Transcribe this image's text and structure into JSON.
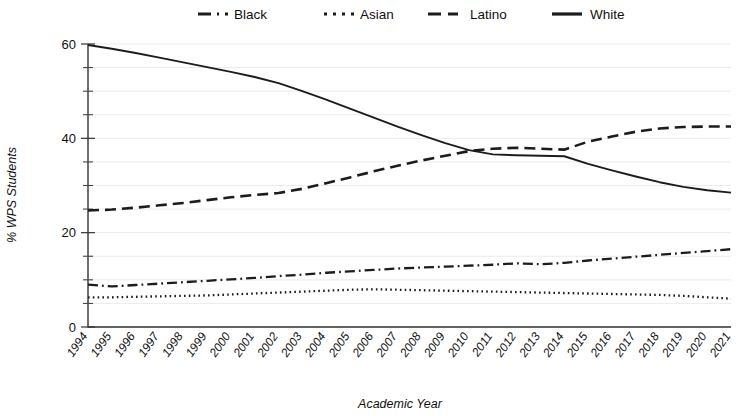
{
  "chart_data": {
    "type": "line",
    "title": "",
    "xlabel": "Academic Year",
    "ylabel": "% WPS Students",
    "xlim": [
      1994,
      2021
    ],
    "ylim": [
      0,
      60
    ],
    "yticks": [
      0,
      20,
      40,
      60
    ],
    "yticks_minor_step": 5,
    "grid": true,
    "legend_position": "top-center",
    "x": [
      1994,
      1995,
      1996,
      1997,
      1998,
      1999,
      2000,
      2001,
      2002,
      2003,
      2004,
      2005,
      2006,
      2007,
      2008,
      2009,
      2010,
      2011,
      2012,
      2013,
      2014,
      2015,
      2016,
      2017,
      2018,
      2019,
      2020,
      2021
    ],
    "categories": [
      "1994",
      "1995",
      "1996",
      "1997",
      "1998",
      "1999",
      "2000",
      "2001",
      "2002",
      "2003",
      "2004",
      "2005",
      "2006",
      "2007",
      "2008",
      "2009",
      "2010",
      "2011",
      "2012",
      "2013",
      "2014",
      "2015",
      "2016",
      "2017",
      "2018",
      "2019",
      "2020",
      "2021"
    ],
    "series": [
      {
        "name": "Black",
        "style": "dash-dot",
        "color": "#1c1c1c",
        "values": [
          9.0,
          8.6,
          8.9,
          9.2,
          9.5,
          9.8,
          10.1,
          10.4,
          10.8,
          11.1,
          11.5,
          11.8,
          12.1,
          12.4,
          12.6,
          12.8,
          13.0,
          13.2,
          13.5,
          13.3,
          13.6,
          14.1,
          14.5,
          14.9,
          15.3,
          15.7,
          16.1,
          16.5
        ]
      },
      {
        "name": "Asian",
        "style": "dotted",
        "color": "#1c1c1c",
        "values": [
          6.3,
          6.3,
          6.4,
          6.5,
          6.6,
          6.7,
          6.9,
          7.1,
          7.3,
          7.5,
          7.7,
          7.9,
          8.0,
          7.9,
          7.8,
          7.7,
          7.6,
          7.5,
          7.4,
          7.3,
          7.2,
          7.1,
          7.0,
          6.9,
          6.8,
          6.6,
          6.3,
          6.0
        ]
      },
      {
        "name": "Latino",
        "style": "dashed",
        "color": "#1c1c1c",
        "values": [
          24.7,
          24.9,
          25.3,
          25.8,
          26.3,
          26.9,
          27.5,
          28.0,
          28.4,
          29.3,
          30.5,
          31.7,
          33.0,
          34.2,
          35.3,
          36.3,
          37.3,
          37.8,
          38.0,
          37.8,
          37.6,
          39.3,
          40.4,
          41.4,
          42.1,
          42.4,
          42.5,
          42.5
        ]
      },
      {
        "name": "White",
        "style": "solid",
        "color": "#1c1c1c",
        "values": [
          59.8,
          59.0,
          58.1,
          57.1,
          56.1,
          55.1,
          54.1,
          53.0,
          51.7,
          50.0,
          48.2,
          46.3,
          44.4,
          42.5,
          40.7,
          39.0,
          37.5,
          36.6,
          36.4,
          36.3,
          36.2,
          34.6,
          33.2,
          31.9,
          30.7,
          29.7,
          29.0,
          28.5
        ]
      }
    ]
  },
  "legend": {
    "items": [
      {
        "label": "Black"
      },
      {
        "label": "Asian"
      },
      {
        "label": "Latino"
      },
      {
        "label": "White"
      }
    ]
  },
  "axes": {
    "y_title": "% WPS Students",
    "x_title": "Academic Year",
    "y_tick_labels": [
      "0",
      "20",
      "40",
      "60"
    ]
  }
}
